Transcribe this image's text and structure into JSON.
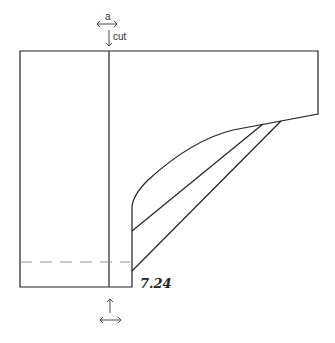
{
  "diagram": {
    "figure_number": "7.24",
    "labels": {
      "top_arrow_label": "a",
      "cut_label": "cut"
    },
    "icons": [
      "double-arrow-horizontal-icon",
      "arrow-down-icon",
      "arrow-up-icon"
    ],
    "colors": {
      "line": "#222222",
      "dashed": "#888888",
      "background": "#ffffff"
    }
  }
}
